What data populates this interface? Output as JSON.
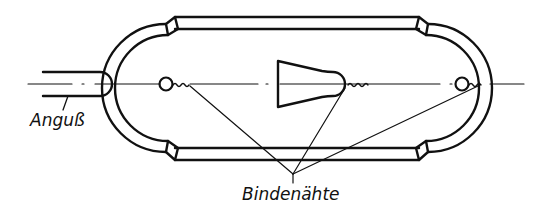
{
  "diagram": {
    "labels": {
      "sprue": "Anguß",
      "weld_lines": "Bindenähte"
    },
    "colors": {
      "stroke": "#111111",
      "background": "#ffffff"
    }
  }
}
